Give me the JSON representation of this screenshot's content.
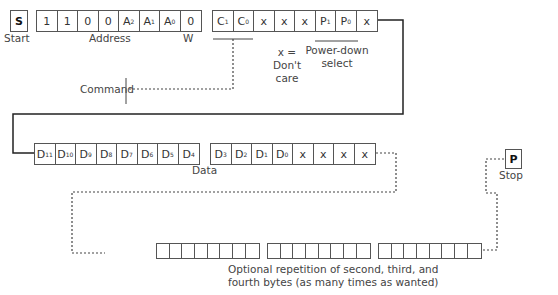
{
  "start": {
    "symbol": "S",
    "label": "Start"
  },
  "stop": {
    "symbol": "P",
    "label": "Stop"
  },
  "address_byte": {
    "cells": [
      {
        "t": "1",
        "s": ""
      },
      {
        "t": "1",
        "s": ""
      },
      {
        "t": "0",
        "s": ""
      },
      {
        "t": "0",
        "s": ""
      },
      {
        "t": "A",
        "s": "2"
      },
      {
        "t": "A",
        "s": "1"
      },
      {
        "t": "A",
        "s": "0"
      },
      {
        "t": "0",
        "s": ""
      }
    ],
    "label": "Address",
    "rw_label": "W"
  },
  "command_byte": {
    "cells": [
      {
        "t": "C",
        "s": "1"
      },
      {
        "t": "C",
        "s": "0"
      },
      {
        "t": "x",
        "s": ""
      },
      {
        "t": "x",
        "s": ""
      },
      {
        "t": "x",
        "s": ""
      },
      {
        "t": "P",
        "s": "1"
      },
      {
        "t": "P",
        "s": "0"
      },
      {
        "t": "x",
        "s": ""
      }
    ],
    "command_label": "Command",
    "dont_care_line1": "x =",
    "dont_care_line2": "Don't",
    "dont_care_line3": "care",
    "powerdown_line1": "Power-down",
    "powerdown_line2": "select"
  },
  "data_byte_high": {
    "cells": [
      {
        "t": "D",
        "s": "11"
      },
      {
        "t": "D",
        "s": "10"
      },
      {
        "t": "D",
        "s": "9"
      },
      {
        "t": "D",
        "s": "8"
      },
      {
        "t": "D",
        "s": "7"
      },
      {
        "t": "D",
        "s": "6"
      },
      {
        "t": "D",
        "s": "5"
      },
      {
        "t": "D",
        "s": "4"
      }
    ]
  },
  "data_byte_low": {
    "cells": [
      {
        "t": "D",
        "s": "3"
      },
      {
        "t": "D",
        "s": "2"
      },
      {
        "t": "D",
        "s": "1"
      },
      {
        "t": "D",
        "s": "0"
      },
      {
        "t": "x",
        "s": ""
      },
      {
        "t": "x",
        "s": ""
      },
      {
        "t": "x",
        "s": ""
      },
      {
        "t": "x",
        "s": ""
      }
    ],
    "label": "Data"
  },
  "repetition": {
    "byte_count": 3,
    "bits_per_byte": 8,
    "line1": "Optional repetition of second, third, and",
    "line2": "fourth bytes (as many times as wanted)"
  }
}
